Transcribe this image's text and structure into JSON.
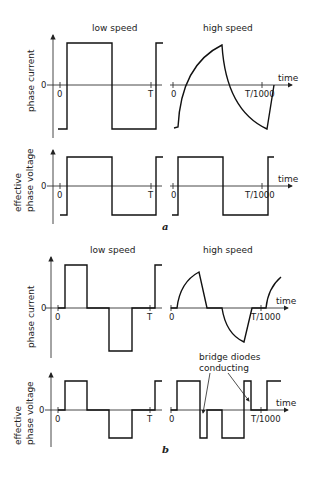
{
  "figure_a": {
    "label": "a",
    "columns": {
      "left": "low speed",
      "right": "high speed"
    },
    "rows": [
      {
        "ylabel": "phase current",
        "zero": "0"
      },
      {
        "ylabel_line1": "effective",
        "ylabel_line2": "phase voltage",
        "zero": "0"
      }
    ],
    "x_ticks": {
      "left_origin": "0",
      "left_end": "T",
      "right_origin": "0",
      "right_end": "T/1000"
    },
    "x_axis_label": "time"
  },
  "figure_b": {
    "label": "b",
    "columns": {
      "left": "low speed",
      "right": "high speed"
    },
    "rows": [
      {
        "ylabel": "phase current",
        "zero": "0"
      },
      {
        "ylabel_line1": "effective",
        "ylabel_line2": "phase voltage",
        "zero": "0"
      }
    ],
    "x_ticks": {
      "left_origin": "0",
      "left_end": "T",
      "right_origin": "0",
      "right_end": "T/1000"
    },
    "x_axis_label": "time",
    "annotation_line1": "bridge diodes",
    "annotation_line2": "conducting"
  }
}
